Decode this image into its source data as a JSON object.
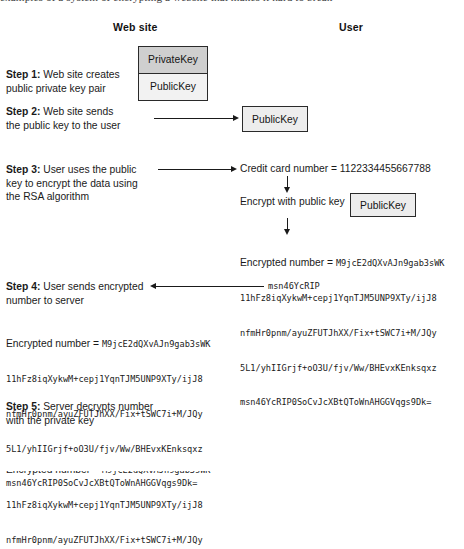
{
  "figure": {
    "running_text_above": "examples of a system of encrypting a website that makes it hard to break",
    "columns": {
      "left_header": "Web site",
      "right_header": "User"
    },
    "steps": [
      {
        "id": "step-1",
        "number": "Step 1:",
        "lines": [
          "Web site creates",
          "public private key pair"
        ]
      },
      {
        "id": "step-2",
        "number": "Step 2:",
        "lines": [
          "Web site sends",
          "the public key to the user"
        ]
      },
      {
        "id": "step-3",
        "number": "Step 3:",
        "lines": [
          "User uses the public",
          "key to encrypt the data using",
          "the RSA algorithm"
        ]
      },
      {
        "id": "step-4",
        "number": "Step 4:",
        "lines": [
          "User sends encrypted",
          "number to server"
        ]
      },
      {
        "id": "step-5",
        "number": "Step 5:",
        "lines": [
          "Server decrypts number",
          "with the private key"
        ]
      }
    ],
    "boxes": {
      "private_key": "PrivateKey",
      "public_key": "PublicKey",
      "public_key_user": "PublicKey",
      "public_key_encrypt": "PublicKey"
    },
    "user_column": {
      "credit_card_line": "Credit card number = 1122334455667788",
      "encrypt_label": "Encrypt with public key"
    },
    "cipher": {
      "label": "Encrypted number = ",
      "line1": "M9jcE2dQXvAJn9gab3sWK",
      "line2": "11hFz8iqXykwM+cepj1YqnTJM5UNP9XTy/ijJ8",
      "line3": "nfmHr0pnm/ayuZFUTJhXX/Fix+tSWC7i+M/JQy",
      "line4": "5L1/yhIIGrjf+oO3U/fjv/Ww/BHEvxKEnksqxz",
      "line5": "msn46YcRIP0SoCvJcXBtQToWnAHGGVqgs9Dk=",
      "fragment_right_of_arrow": "msn46YcRIP"
    },
    "colors": {
      "private_key_fill": "#cfcfcf",
      "public_key_fill": "#f2f2f2",
      "box_border": "#2a2a2a",
      "text": "#1a1a1a",
      "background": "#ffffff"
    }
  }
}
